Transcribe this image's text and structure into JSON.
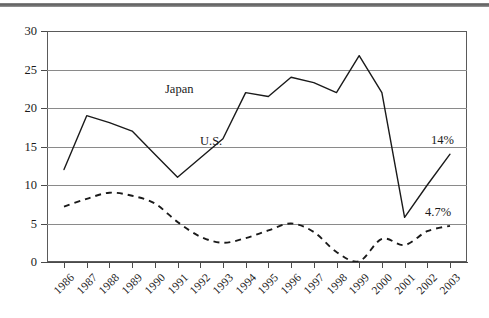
{
  "chart_data": {
    "type": "line",
    "title": "",
    "subtitle": "",
    "xlabel": "",
    "ylabel": "",
    "xlim": [
      1986,
      2003
    ],
    "ylim": [
      0,
      30
    ],
    "ytick_values": [
      0,
      5,
      10,
      15,
      20,
      25,
      30
    ],
    "ytick_labels": [
      "0",
      "5",
      "10",
      "15",
      "20",
      "25",
      "30"
    ],
    "grid": "horizontal",
    "legend": "inline-labels",
    "categories": [
      "1986",
      "1987",
      "1988",
      "1989",
      "1990",
      "1991",
      "1992",
      "1993",
      "1994",
      "1995",
      "1996",
      "1997",
      "1998",
      "1999",
      "2000",
      "2001",
      "2002",
      "2003"
    ],
    "series": [
      {
        "name": "U.S.",
        "style": "solid",
        "color": "#1a1a1a",
        "values": [
          12,
          19,
          18.1,
          17,
          14,
          11,
          13.5,
          16,
          22,
          21.5,
          24,
          23.3,
          22,
          26.8,
          22,
          5.8,
          10,
          14
        ]
      },
      {
        "name": "Japan",
        "style": "dashed",
        "color": "#1a1a1a",
        "values": [
          7.2,
          8.2,
          9,
          8.6,
          7.6,
          5.2,
          3.3,
          2.5,
          3.1,
          4.1,
          5,
          3.9,
          1.3,
          0.1,
          3,
          2.2,
          4,
          4.7
        ]
      }
    ],
    "annotations": [
      {
        "text": "U.S.",
        "kind": "series-label",
        "series": "U.S.",
        "at_x": 1992,
        "at_y": 13.9
      },
      {
        "text": "Japan",
        "kind": "series-label",
        "series": "Japan",
        "at_x": 1992,
        "at_y": 7.6
      },
      {
        "text": "14%",
        "kind": "end-value",
        "series": "U.S.",
        "at_x": 2003,
        "at_y": 14
      },
      {
        "text": "4.7%",
        "kind": "end-value",
        "series": "Japan",
        "at_x": 2003,
        "at_y": 4.7
      }
    ]
  }
}
